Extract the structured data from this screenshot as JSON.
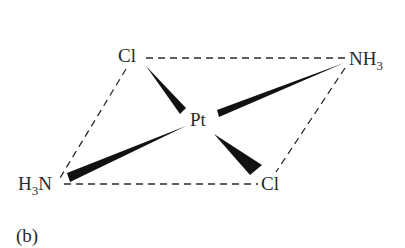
{
  "figure": {
    "caption": "(b)",
    "center_atom": "Pt",
    "ligands": {
      "top_left": "Cl",
      "top_right_main": "NH",
      "top_right_sub": "3",
      "bottom_left_sub": "3",
      "bottom_left_prefix": "H",
      "bottom_left_suffix": "N",
      "bottom_right": "Cl"
    },
    "colors": {
      "ink": "#2a2a2a",
      "wedge": "#111111",
      "background": "#ffffff"
    }
  }
}
